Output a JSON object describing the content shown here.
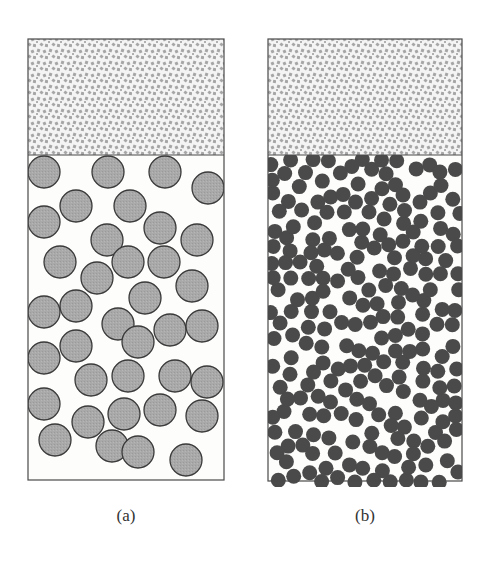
{
  "figure": {
    "panels": [
      {
        "id": "a",
        "label": "(a)",
        "box": {
          "x": 28,
          "y": 39,
          "w": 196,
          "h": 441,
          "divider_y": 155
        },
        "upper_region": {
          "fill": "speckled",
          "description": "dense fine-grained fluid phase"
        },
        "particles": {
          "radius": 16,
          "fill": "#a9a9a9",
          "stroke": "#3a3a3a",
          "positions": [
            [
              44,
              172
            ],
            [
              108,
              172
            ],
            [
              165,
              172
            ],
            [
              208,
              188
            ],
            [
              76,
              206
            ],
            [
              130,
              206
            ],
            [
              44,
              222
            ],
            [
              160,
              228
            ],
            [
              107,
              240
            ],
            [
              197,
              240
            ],
            [
              128,
              262
            ],
            [
              60,
              262
            ],
            [
              164,
              262
            ],
            [
              97,
              278
            ],
            [
              192,
              286
            ],
            [
              76,
              306
            ],
            [
              145,
              298
            ],
            [
              44,
              312
            ],
            [
              118,
              324
            ],
            [
              170,
              330
            ],
            [
              138,
              342
            ],
            [
              202,
              326
            ],
            [
              76,
              346
            ],
            [
              44,
              358
            ],
            [
              128,
              376
            ],
            [
              91,
              380
            ],
            [
              175,
              376
            ],
            [
              207,
              382
            ],
            [
              44,
              404
            ],
            [
              88,
              422
            ],
            [
              124,
              414
            ],
            [
              160,
              410
            ],
            [
              202,
              416
            ],
            [
              55,
              440
            ],
            [
              112,
              446
            ],
            [
              138,
              452
            ],
            [
              186,
              460
            ]
          ]
        }
      },
      {
        "id": "b",
        "label": "(b)",
        "box": {
          "x": 268,
          "y": 39,
          "w": 194,
          "h": 442,
          "divider_y": 155
        },
        "upper_region": {
          "fill": "speckled",
          "description": "dense fine-grained fluid phase"
        },
        "particles": {
          "radius": 7.5,
          "fill": "#4a4a4a",
          "stroke": "none",
          "count_approx": 230
        }
      }
    ]
  }
}
